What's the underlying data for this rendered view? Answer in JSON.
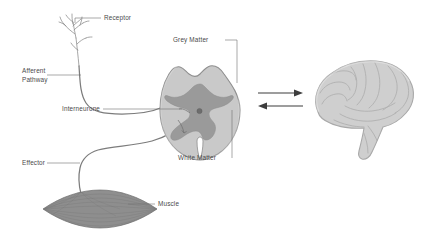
{
  "figure": {
    "background_color": "#ffffff",
    "label_color": "#4a4a4a",
    "leader_color": "#6f6f6f"
  },
  "labels": {
    "receptor": "Receptor",
    "afferent_line1": "Afferent",
    "afferent_line2": "Pathway",
    "interneurone": "Interneurone",
    "grey_matter": "Grey Matter",
    "white_matter": "White Matter",
    "effector": "Effector",
    "muscle": "Muscle"
  },
  "structures": {
    "spinal_cord": {
      "name": "spinal-cord-cross-section",
      "white_matter_fill": "#c9c9c9",
      "white_matter_stroke": "#8e8e8e",
      "grey_matter_fill": "#9a9a9a",
      "central_canal_fill": "#6d6d6d"
    },
    "brain": {
      "name": "brain",
      "fill": "#cfcfcf",
      "stroke": "#a8a8a8",
      "gyri_stroke": "#b0b0b0"
    },
    "muscle": {
      "name": "muscle",
      "fill": "#8f8f8f",
      "stroke": "#6b6b6b",
      "striation_stroke": "#777777"
    },
    "receptor": {
      "name": "sensory-receptor-nerve-ending",
      "stroke": "#8a8a8a"
    },
    "neuron_pathway_stroke": "#7c7c7c"
  },
  "arrows": {
    "top": {
      "name": "cord-to-brain-arrow",
      "direction": "right",
      "color": "#3d3d3d"
    },
    "bottom": {
      "name": "brain-to-cord-arrow",
      "direction": "left",
      "color": "#3d3d3d"
    }
  }
}
